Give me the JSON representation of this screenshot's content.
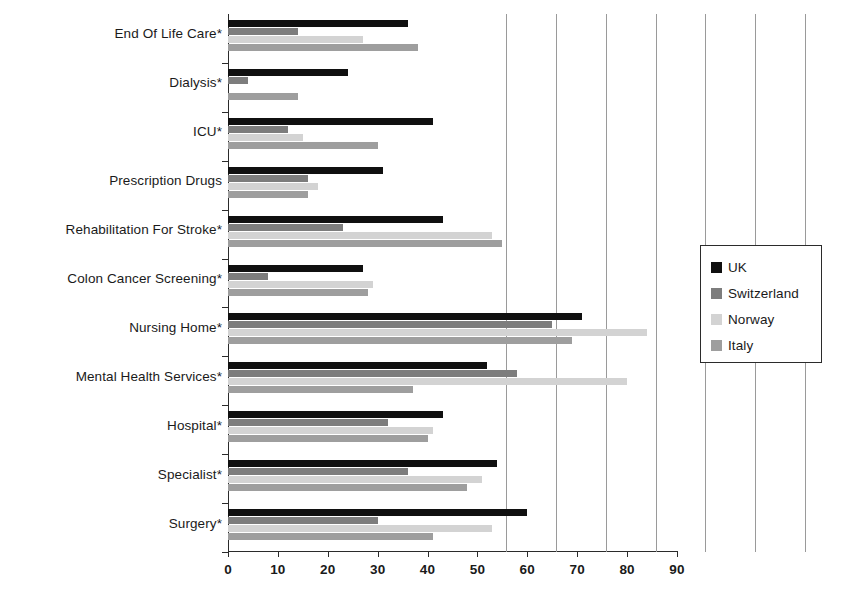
{
  "chart_data": {
    "type": "bar",
    "orientation": "horizontal",
    "title": "",
    "subtitle": "",
    "xlabel": "",
    "ylabel": "",
    "xlim": [
      0,
      90
    ],
    "xticks": [
      0,
      10,
      20,
      30,
      40,
      50,
      60,
      70,
      80,
      90
    ],
    "xtick_labels": [
      "0",
      "10",
      "20",
      "30",
      "40",
      "50",
      "60",
      "70",
      "80",
      "90"
    ],
    "grid": true,
    "grid_axis": "x",
    "legend_position": "right",
    "categories": [
      "End Of Life Care*",
      "Dialysis*",
      "ICU*",
      "Prescription Drugs",
      "Rehabilitation For Stroke*",
      "Colon Cancer Screening*",
      "Nursing Home*",
      "Mental Health Services*",
      "Hospital*",
      "Specialist*",
      "Surgery*"
    ],
    "series": [
      {
        "name": "UK",
        "color": "#101010",
        "values": [
          36,
          24,
          41,
          31,
          43,
          27,
          71,
          52,
          43,
          54,
          60
        ]
      },
      {
        "name": "Switzerland",
        "color": "#7d7d7d",
        "values": [
          14,
          4,
          12,
          16,
          23,
          8,
          65,
          58,
          32,
          36,
          30
        ]
      },
      {
        "name": "Norway",
        "color": "#d3d3d3",
        "values": [
          27,
          0,
          15,
          18,
          53,
          29,
          84,
          80,
          41,
          51,
          53
        ]
      },
      {
        "name": "Italy",
        "color": "#9e9e9e",
        "values": [
          38,
          14,
          30,
          16,
          55,
          28,
          69,
          37,
          40,
          48,
          41
        ]
      }
    ]
  },
  "legend": {
    "items": [
      {
        "label": "UK",
        "color": "#101010"
      },
      {
        "label": "Switzerland",
        "color": "#7d7d7d"
      },
      {
        "label": "Norway",
        "color": "#d3d3d3"
      },
      {
        "label": "Italy",
        "color": "#9e9e9e"
      }
    ]
  }
}
